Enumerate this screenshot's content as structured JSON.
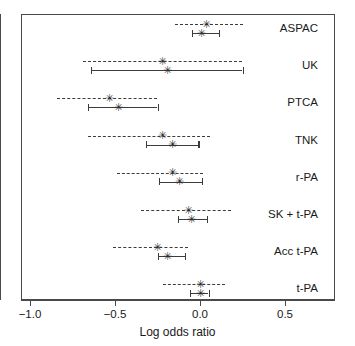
{
  "chart_data": {
    "type": "scatter",
    "title": "",
    "xlabel": "Log odds ratio",
    "ylabel": "",
    "xlim": [
      -1.15,
      0.79
    ],
    "xticks": [
      -1.0,
      -0.5,
      0.0,
      0.5
    ],
    "xtick_labels": [
      "-1.0",
      "-0.5",
      "0.0",
      "0.5"
    ],
    "grid": false,
    "legend": "none",
    "reference_line": 0.0,
    "categories": [
      "ASPAC",
      "UK",
      "PTCA",
      "TNK",
      "r-PA",
      "SK + t-PA",
      "Acc t-PA",
      "t-PA"
    ],
    "series": [
      {
        "name": "dashed",
        "linestyle": "dashed",
        "values": [
          {
            "category": "ASPAC",
            "estimate": 0.04,
            "ci_low": -0.15,
            "ci_high": 0.25
          },
          {
            "category": "UK",
            "estimate": -0.22,
            "ci_low": -0.69,
            "ci_high": 0.25
          },
          {
            "category": "PTCA",
            "estimate": -0.53,
            "ci_low": -0.84,
            "ci_high": -0.25
          },
          {
            "category": "TNK",
            "estimate": -0.22,
            "ci_low": -0.66,
            "ci_high": 0.06
          },
          {
            "category": "r-PA",
            "estimate": -0.16,
            "ci_low": -0.49,
            "ci_high": 0.02
          },
          {
            "category": "SK + t-PA",
            "estimate": -0.07,
            "ci_low": -0.35,
            "ci_high": 0.18
          },
          {
            "category": "Acc t-PA",
            "estimate": -0.25,
            "ci_low": -0.51,
            "ci_high": -0.07
          },
          {
            "category": "t-PA",
            "estimate": 0.0,
            "ci_low": -0.22,
            "ci_high": 0.15
          }
        ]
      },
      {
        "name": "solid",
        "linestyle": "solid",
        "values": [
          {
            "category": "ASPAC",
            "estimate": 0.01,
            "ci_low": -0.05,
            "ci_high": 0.11
          },
          {
            "category": "UK",
            "estimate": -0.19,
            "ci_low": -0.64,
            "ci_high": 0.25
          },
          {
            "category": "PTCA",
            "estimate": -0.48,
            "ci_low": -0.66,
            "ci_high": -0.25
          },
          {
            "category": "TNK",
            "estimate": -0.16,
            "ci_low": -0.32,
            "ci_high": -0.01
          },
          {
            "category": "r-PA",
            "estimate": -0.12,
            "ci_low": -0.24,
            "ci_high": 0.01
          },
          {
            "category": "SK + t-PA",
            "estimate": -0.05,
            "ci_low": -0.13,
            "ci_high": 0.04
          },
          {
            "category": "Acc t-PA",
            "estimate": -0.19,
            "ci_low": -0.25,
            "ci_high": -0.09
          },
          {
            "category": "t-PA",
            "estimate": 0.0,
            "ci_low": -0.06,
            "ci_high": 0.05
          }
        ]
      }
    ]
  },
  "axis": {
    "title": "Log odds ratio",
    "ticks": [
      {
        "value": -1.0,
        "label": "-1.0"
      },
      {
        "value": -0.5,
        "label": "-0.5"
      },
      {
        "value": 0.0,
        "label": "0.0"
      },
      {
        "value": 0.5,
        "label": "0.5"
      }
    ]
  },
  "labels": [
    {
      "text": "ASPAC"
    },
    {
      "text": "UK"
    },
    {
      "text": "PTCA"
    },
    {
      "text": "TNK"
    },
    {
      "text": "r-PA"
    },
    {
      "text": "SK + t-PA"
    },
    {
      "text": "Acc t-PA"
    },
    {
      "text": "t-PA"
    }
  ],
  "colors": {
    "line": "#3c3c3c",
    "frame": "#4a4a4a",
    "text": "#1a1a1a",
    "background": "#ffffff"
  }
}
